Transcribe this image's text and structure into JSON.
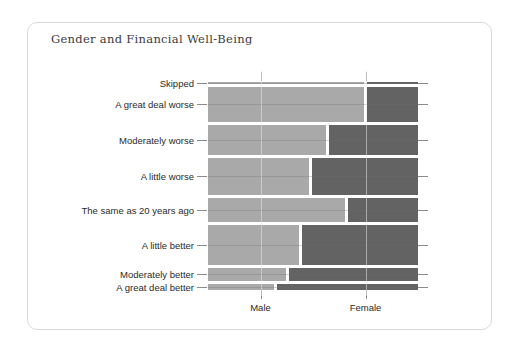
{
  "card": {
    "title": "Gender and Financial Well-Being"
  },
  "chart_data": {
    "type": "bar",
    "subtype": "mosaic-spine-plot",
    "title": "Gender and Financial Well-Being",
    "xlabel": "",
    "ylabel": "",
    "grid": true,
    "legend_position": "none",
    "x_categories": [
      "Male",
      "Female"
    ],
    "x_tick_labels": [
      "Male",
      "Female"
    ],
    "y_categories": [
      "Skipped",
      "A great deal worse",
      "Moderately worse",
      "A little worse",
      "The same as 20 years ago",
      "A little better",
      "Moderately better",
      "A great deal better"
    ],
    "series": [
      {
        "name": "Male",
        "color": "#a9a9a9",
        "values": [
          0.75,
          0.75,
          0.57,
          0.49,
          0.66,
          0.44,
          0.38,
          0.32
        ]
      },
      {
        "name": "Female",
        "color": "#636363",
        "values": [
          0.25,
          0.25,
          0.43,
          0.51,
          0.34,
          0.56,
          0.62,
          0.68
        ]
      }
    ],
    "row_heights_fraction": [
      0.008,
      0.175,
      0.15,
      0.185,
      0.12,
      0.2,
      0.065,
      0.03
    ]
  }
}
